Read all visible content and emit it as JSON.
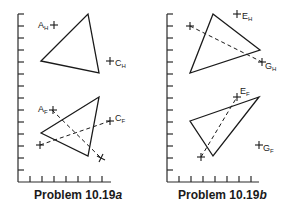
{
  "panels": [
    {
      "id": "a",
      "caption_prefix": "Problem 10.19",
      "caption_suffix": "a",
      "views": [
        {
          "name": "horizontal-view",
          "points": [
            {
              "letter": "A",
              "sub": "H"
            },
            {
              "letter": "C",
              "sub": "H"
            }
          ]
        },
        {
          "name": "frontal-view",
          "points": [
            {
              "letter": "A",
              "sub": "F"
            },
            {
              "letter": "C",
              "sub": "F"
            }
          ]
        }
      ]
    },
    {
      "id": "b",
      "caption_prefix": "Problem 10.19",
      "caption_suffix": "b",
      "views": [
        {
          "name": "horizontal-view",
          "points": [
            {
              "letter": "E",
              "sub": "H"
            },
            {
              "letter": "G",
              "sub": "H"
            }
          ]
        },
        {
          "name": "frontal-view",
          "points": [
            {
              "letter": "E",
              "sub": "F"
            },
            {
              "letter": "G",
              "sub": "F"
            }
          ]
        }
      ]
    }
  ]
}
